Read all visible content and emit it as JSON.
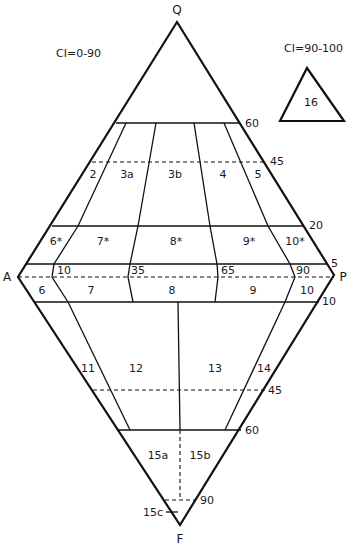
{
  "diagram": {
    "type": "QAPF double-triangle classification diagram",
    "vertices": {
      "Q": "Q",
      "A": "A",
      "P": "P",
      "F": "F"
    },
    "ci_main": "CI=0-90",
    "ci_inset": "CI=90-100",
    "inset_field": "16",
    "tick_labels": {
      "q60": "60",
      "q45": "45",
      "q20": "20",
      "q5": "5",
      "p10_upper": "10",
      "p35": "35",
      "p65": "65",
      "p90": "90",
      "f10": "10",
      "f45": "45",
      "f60": "60",
      "f90": "90"
    },
    "fields": {
      "f2": "2",
      "f3a": "3a",
      "f3b": "3b",
      "f4": "4",
      "f5": "5",
      "f6s": "6*",
      "f7s": "7*",
      "f8s": "8*",
      "f9s": "9*",
      "f10s": "10*",
      "f6": "6",
      "f7": "7",
      "f8": "8",
      "f9": "9",
      "f10": "10",
      "f11": "11",
      "f12": "12",
      "f13": "13",
      "f14": "14",
      "f15a": "15a",
      "f15b": "15b",
      "f15c": "15c"
    }
  }
}
